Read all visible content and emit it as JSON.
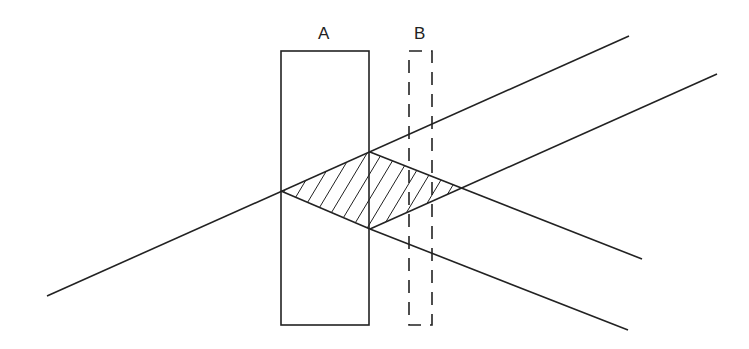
{
  "diagram": {
    "labels": {
      "a": "A",
      "b": "B"
    },
    "colors": {
      "stroke": "#222222",
      "background": "#ffffff"
    },
    "elements": {
      "plate_a": {
        "x": 281,
        "y": 51,
        "width": 88,
        "height": 274,
        "style": "solid"
      },
      "plate_b": {
        "x": 409,
        "y": 51,
        "width": 23,
        "height": 274,
        "style": "dashed"
      },
      "hatched_region": {
        "points": [
          [
            281,
            191
          ],
          [
            370,
            152
          ],
          [
            462,
            188
          ],
          [
            370,
            229
          ]
        ]
      }
    }
  }
}
